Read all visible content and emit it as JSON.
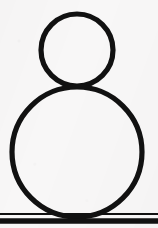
{
  "canvas": {
    "width": 158,
    "height": 228,
    "background_color": "#f8f7f7",
    "ink_color": "#111111",
    "description": "black outline drawing of two stacked circles above two horizontal rules"
  },
  "figure": {
    "stroke_color": "#111111",
    "fill_color": "none",
    "shapes": [
      {
        "name": "small-circle",
        "type": "circle",
        "cx": 77,
        "cy": 50,
        "r": 36,
        "stroke_width": 5.2
      },
      {
        "name": "large-circle",
        "type": "circle",
        "cx": 77,
        "cy": 152,
        "r": 65,
        "stroke_width": 5.2
      }
    ],
    "rules": [
      {
        "name": "upper-baseline",
        "type": "line",
        "x1": 0,
        "y1": 214,
        "x2": 158,
        "y2": 214,
        "stroke_width": 2.2
      },
      {
        "name": "lower-baseline",
        "type": "line",
        "x1": 0,
        "y1": 221,
        "x2": 158,
        "y2": 221,
        "stroke_width": 5.4
      }
    ]
  }
}
